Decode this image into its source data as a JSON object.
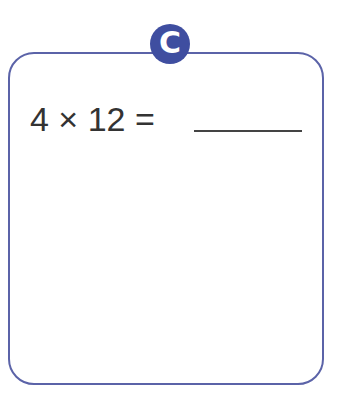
{
  "badge": {
    "label": "C",
    "color": "#3f4ea0"
  },
  "problem": {
    "expression": "4 × 12 ="
  },
  "answer": {
    "value": ""
  },
  "colors": {
    "border": "#5b63a8",
    "text": "#333333"
  }
}
